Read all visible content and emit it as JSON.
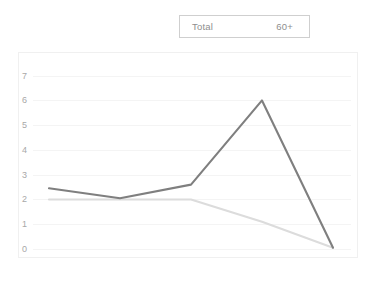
{
  "legend": {
    "entries": [
      {
        "label": "Total",
        "color": "#7f7f7f"
      },
      {
        "label": "60+",
        "color": "#dcdcdc"
      }
    ]
  },
  "chart_data": {
    "type": "line",
    "title": "",
    "xlabel": "",
    "ylabel": "",
    "categories": [
      "1950-55",
      "1975-80",
      "2000-05",
      "2025-30",
      "2045-50"
    ],
    "yticks": [
      0,
      1,
      2,
      3,
      4,
      5,
      6,
      7
    ],
    "ylim": [
      0,
      7.35
    ],
    "grid": true,
    "legend_position": "top-center",
    "series": [
      {
        "name": "Total",
        "color": "#7f7f7f",
        "values": [
          2.45,
          2.05,
          2.6,
          6.0,
          0.05
        ]
      },
      {
        "name": "60+",
        "color": "#dcdcdc",
        "values": [
          2.0,
          2.0,
          2.0,
          1.1,
          0.05
        ]
      }
    ]
  }
}
